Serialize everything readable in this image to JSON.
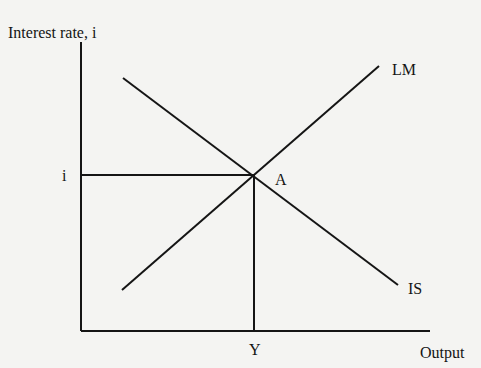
{
  "diagram": {
    "type": "IS-LM",
    "y_axis_label": "Interest rate, i",
    "x_axis_label": "Output",
    "curves": [
      {
        "name": "LM",
        "label": "LM",
        "slope": "upward",
        "from": [
          122,
          290
        ],
        "to": [
          379,
          66
        ]
      },
      {
        "name": "IS",
        "label": "IS",
        "slope": "downward",
        "from": [
          123,
          78
        ],
        "to": [
          398,
          285
        ]
      }
    ],
    "equilibrium": {
      "point_label": "A",
      "interest_label": "i",
      "output_label": "Y",
      "x": 254,
      "y": 175
    },
    "axes": {
      "origin": [
        81,
        331
      ],
      "y_top": 42,
      "x_right": 430
    },
    "colors": {
      "line": "#151515",
      "background": "#f4f4f2"
    }
  }
}
